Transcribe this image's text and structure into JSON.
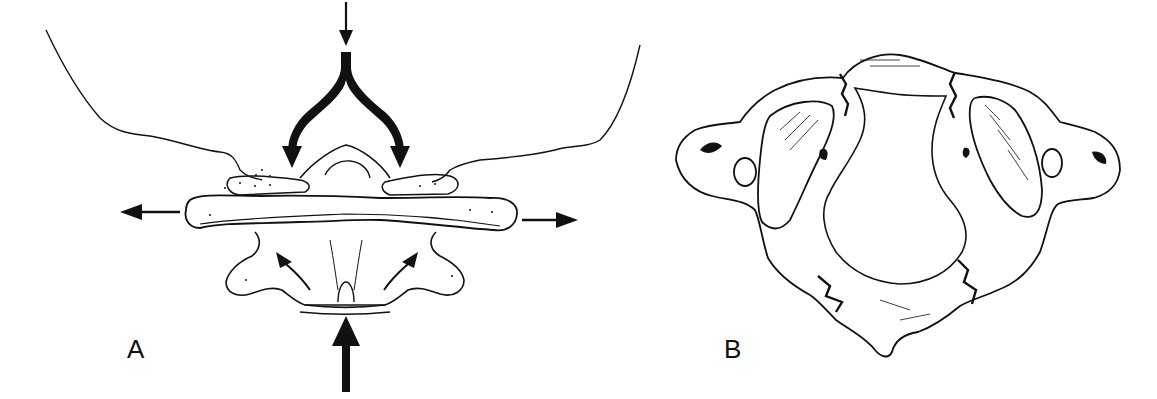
{
  "figure": {
    "panels": [
      {
        "id": "A",
        "label": "A",
        "description": "Coronal view of atlas (C1) with axial load: downward force from skull splitting onto lateral masses, lateral masses displaced outward",
        "arrows": [
          "axial-load-down",
          "fork-left-down",
          "fork-right-down",
          "lateral-left",
          "lateral-right",
          "axis-upward",
          "inner-left-up",
          "inner-right-up"
        ]
      },
      {
        "id": "B",
        "label": "B",
        "description": "Superior view of atlas ring showing fractures of anterior and posterior arches"
      }
    ],
    "colors": {
      "ink": "#111111",
      "background": "#ffffff"
    }
  }
}
